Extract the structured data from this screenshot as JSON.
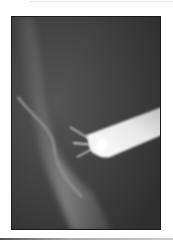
{
  "image": {
    "description": "Radiograph (X-ray) of a femoral head / hip region with a bright radiopaque tube and wire filaments",
    "colors": {
      "background": "#ffffff",
      "film_dark": "#3f3f3f",
      "bone_highlight": "#9a9a9a",
      "device_bright": "#f4f4f4"
    }
  }
}
